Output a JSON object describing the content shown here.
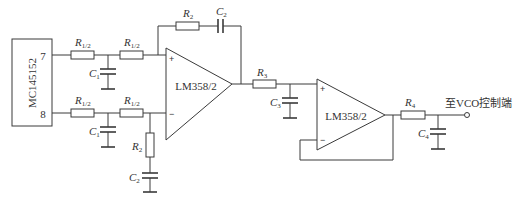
{
  "diagram": {
    "type": "circuit-schematic",
    "chip": {
      "label": "MC145152",
      "pins": [
        "7",
        "8"
      ]
    },
    "input_filter": {
      "resistor_label": "R",
      "resistor_sub": "1/2",
      "cap_label": "C",
      "cap_sub": "1"
    },
    "opamp1": {
      "label": "LM358/2",
      "plus": "+",
      "minus": "−",
      "feedback": {
        "r_label": "R",
        "r_sub": "2",
        "c_label": "C",
        "c_sub": "2"
      },
      "ground_leg": {
        "r_label": "R",
        "r_sub": "2",
        "c_label": "C",
        "c_sub": "2"
      }
    },
    "stage2_filter": {
      "r_label": "R",
      "r_sub": "3",
      "c_label": "C",
      "c_sub": "3"
    },
    "opamp2": {
      "label": "LM358/2",
      "plus": "+",
      "minus": "−"
    },
    "output_filter": {
      "r_label": "R",
      "r_sub": "4",
      "c_label": "C",
      "c_sub": "4"
    },
    "output": {
      "label": "至VCO控制端"
    }
  }
}
